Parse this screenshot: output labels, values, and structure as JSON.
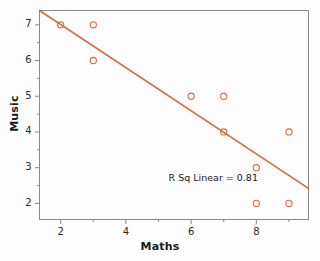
{
  "chart_data": {
    "type": "scatter",
    "title": "",
    "xlabel": "Maths",
    "ylabel": "Music",
    "xlim": [
      1.35,
      9.6
    ],
    "ylim": [
      1.55,
      7.4
    ],
    "xticks": [
      2,
      4,
      6,
      8
    ],
    "yticks": [
      2,
      3,
      4,
      5,
      6,
      7
    ],
    "xtick_labels": [
      "2",
      "4",
      "6",
      "8"
    ],
    "ytick_labels": [
      "2",
      "3",
      "4",
      "5",
      "6",
      "7"
    ],
    "grid": false,
    "legend": "none",
    "points": [
      {
        "x": 2,
        "y": 7
      },
      {
        "x": 3,
        "y": 7
      },
      {
        "x": 3,
        "y": 6
      },
      {
        "x": 6,
        "y": 5
      },
      {
        "x": 7,
        "y": 5
      },
      {
        "x": 7,
        "y": 4
      },
      {
        "x": 9,
        "y": 4
      },
      {
        "x": 8,
        "y": 3
      },
      {
        "x": 8,
        "y": 2
      },
      {
        "x": 9,
        "y": 2
      }
    ],
    "fit_line": {
      "type": "linear",
      "x_start": 1.35,
      "y_start": 7.4,
      "x_end": 9.6,
      "y_end": 2.42
    },
    "annotations": [
      {
        "text": "R Sq Linear = 0.81",
        "x": 8.05,
        "y": 2.72
      }
    ]
  },
  "annotation": {
    "rsq_text": "R Sq Linear = 0.81"
  },
  "colors": {
    "marker": "#DE6B3C",
    "fit_line": "#DB6A3B",
    "axis": "#8a8a8a",
    "text": "#1a1a1a",
    "background": "#fdfdfd"
  },
  "marker_style": {
    "shape": "open-circle",
    "radius": 3.1,
    "stroke_width": 1.1
  }
}
